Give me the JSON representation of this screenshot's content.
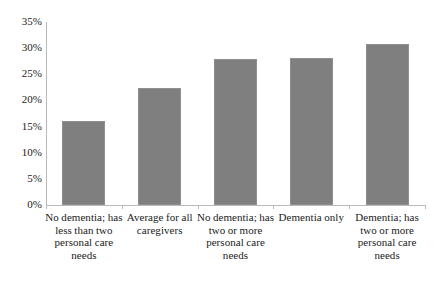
{
  "chart_data": {
    "type": "bar",
    "title": "",
    "subtitle": "",
    "xlabel": "",
    "ylabel": "",
    "ylim": [
      0,
      35
    ],
    "ytick_labels": [
      "0%",
      "5%",
      "10%",
      "15%",
      "20%",
      "25%",
      "30%",
      "35%"
    ],
    "ytick_values": [
      0,
      5,
      10,
      15,
      20,
      25,
      30,
      35
    ],
    "grid": false,
    "legend": null,
    "bar_color": "#7f7f7f",
    "axis_color": "#b9b9b9",
    "categories": [
      "No dementia; has less than two personal care needs",
      "Average for all caregivers",
      "No dementia; has two or more personal care needs",
      "Dementia only",
      "Dementia; has two or more personal care needs"
    ],
    "category_lines": [
      [
        "No dementia; has",
        "less than two",
        "personal care",
        "needs"
      ],
      [
        "Average for all",
        "caregivers"
      ],
      [
        "No dementia; has",
        "two or more",
        "personal care",
        "needs"
      ],
      [
        "Dementia only"
      ],
      [
        "Dementia; has",
        "two or more",
        "personal care",
        "needs"
      ]
    ],
    "values": [
      16.0,
      22.3,
      28.0,
      28.2,
      30.8
    ],
    "value_labels": [
      "16%",
      "22.3%",
      "28%",
      "28.2%",
      "30.8%"
    ]
  }
}
